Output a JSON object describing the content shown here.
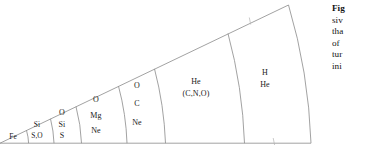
{
  "figure": {
    "name": "stellar-onion-shell-wedge",
    "stroke_color": "#8a8a8a",
    "background_color": "#ffffff",
    "text_color": "#1a1a1a",
    "shells": [
      {
        "id": "shell-fe",
        "lines": [
          "Fe"
        ],
        "label_x": 13,
        "label_y": 137,
        "size": "tiny"
      },
      {
        "id": "shell-si-so",
        "lines": [
          "Si",
          "S,O"
        ],
        "label_x": 37,
        "label_y": 131,
        "size": "tiny"
      },
      {
        "id": "shell-o-si-s",
        "lines": [
          "O",
          "Si",
          "S"
        ],
        "label_x": 62,
        "label_y": 124,
        "size": "small"
      },
      {
        "id": "shell-o-mg-ne",
        "lines": [
          "O",
          "Mg",
          "Ne"
        ],
        "label_x": 96,
        "label_y": 115,
        "size": "small"
      },
      {
        "id": "shell-o-c-ne",
        "lines": [
          "O",
          "C",
          "Ne"
        ],
        "label_x": 137,
        "label_y": 105,
        "size": "small"
      },
      {
        "id": "shell-he-cno",
        "lines": [
          "He",
          "(C,N,O)"
        ],
        "label_x": 196,
        "label_y": 88,
        "size": "small"
      },
      {
        "id": "shell-h-he",
        "lines": [
          "H",
          "He"
        ],
        "label_x": 265,
        "label_y": 79,
        "size": "small"
      }
    ],
    "tick_marks": [
      {
        "id": "tick-upper-boundary",
        "x": 250,
        "y": 21
      },
      {
        "id": "tick-lower-boundary",
        "x": 274,
        "y": 141
      }
    ]
  },
  "caption": {
    "name": "figure-caption-truncated",
    "lines": [
      {
        "text": "Fig",
        "lead": true
      },
      {
        "text": "siv",
        "lead": false
      },
      {
        "text": "tha",
        "lead": false
      },
      {
        "text": "of",
        "lead": false
      },
      {
        "text": "tur",
        "lead": false
      },
      {
        "text": "ini",
        "lead": false
      }
    ]
  }
}
